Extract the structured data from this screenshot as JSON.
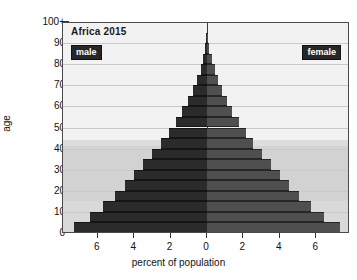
{
  "chart_data": {
    "type": "bar",
    "subtype": "population-pyramid",
    "title": "Africa 2015",
    "xlabel": "percent of population",
    "ylabel": "age",
    "xlim": [
      -8,
      8
    ],
    "ylim": [
      0,
      105
    ],
    "grid": true,
    "legend_position": "inside-top-corners",
    "xtick_labels": [
      "6",
      "4",
      "2",
      "0",
      "2",
      "4",
      "6"
    ],
    "xtick_values": [
      -6,
      -4,
      -2,
      0,
      2,
      4,
      6
    ],
    "ytick_labels": [
      "0",
      "10",
      "20",
      "30",
      "40",
      "50",
      "60",
      "70",
      "80",
      "90",
      "100+"
    ],
    "ytick_values": [
      0,
      10,
      20,
      30,
      40,
      50,
      60,
      70,
      80,
      90,
      100
    ],
    "age_groups": [
      "0-4",
      "5-9",
      "10-14",
      "15-19",
      "20-24",
      "25-29",
      "30-34",
      "35-39",
      "40-44",
      "45-49",
      "50-54",
      "55-59",
      "60-64",
      "65-69",
      "70-74",
      "75-79",
      "80-84",
      "85-89",
      "90+"
    ],
    "series": [
      {
        "name": "male",
        "color": "#2b2b2b",
        "side": "left",
        "values": [
          7.3,
          6.45,
          5.7,
          5.05,
          4.5,
          4.0,
          3.5,
          3.0,
          2.55,
          2.1,
          1.7,
          1.35,
          1.05,
          0.78,
          0.55,
          0.35,
          0.2,
          0.1,
          0.05
        ]
      },
      {
        "name": "female",
        "color": "#4f4f4f",
        "side": "right",
        "values": [
          7.3,
          6.45,
          5.7,
          5.05,
          4.5,
          4.0,
          3.5,
          3.0,
          2.55,
          2.15,
          1.75,
          1.4,
          1.1,
          0.85,
          0.62,
          0.42,
          0.25,
          0.12,
          0.06
        ]
      }
    ],
    "background_bands": [
      {
        "from_age": 0,
        "to_age": 15,
        "shade": "#d9d9d9"
      },
      {
        "from_age": 15,
        "to_age": 41,
        "shade": "#d2d2d2"
      },
      {
        "from_age": 41,
        "to_age": 44,
        "shade": "#dcdcdc"
      },
      {
        "from_age": 44,
        "to_age": 105,
        "shade": "#f2f2f2"
      }
    ]
  },
  "legend": {
    "male_label": "male",
    "female_label": "female"
  }
}
